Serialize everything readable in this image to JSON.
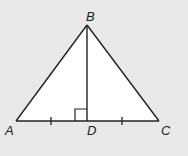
{
  "figure": {
    "type": "isosceles-triangle-with-altitude",
    "background_color": "#e9e9e9",
    "fill_color": "#ffffff",
    "stroke_color": "#222222",
    "vertices": {
      "A": {
        "label": "A",
        "x": 16,
        "y": 121
      },
      "B": {
        "label": "B",
        "x": 87,
        "y": 25
      },
      "C": {
        "label": "C",
        "x": 159,
        "y": 121
      },
      "D": {
        "label": "D",
        "x": 87,
        "y": 121
      }
    },
    "segments": [
      "AB",
      "BC",
      "AC",
      "BD"
    ],
    "right_angle": {
      "at": "D",
      "between": [
        "BD",
        "AD"
      ],
      "size": 12
    },
    "congruence_ticks": [
      {
        "segment": "AD",
        "count": 1
      },
      {
        "segment": "DC",
        "count": 1
      }
    ]
  },
  "labels": {
    "A": "A",
    "B": "B",
    "C": "C",
    "D": "D"
  }
}
